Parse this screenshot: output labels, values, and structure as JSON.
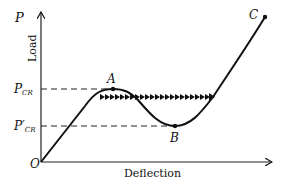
{
  "diagram": {
    "axes": {
      "y_symbol": "P",
      "y_label": "Load",
      "x_label": "Deflection",
      "origin": "O"
    },
    "levels": {
      "upper": {
        "main": "P",
        "sub": "CR"
      },
      "lower": {
        "main": "P′",
        "sub": "CR"
      }
    },
    "points": {
      "A": "A",
      "B": "B",
      "C": "C"
    },
    "colors": {
      "line": "#111111",
      "background": "#ffffff"
    }
  }
}
